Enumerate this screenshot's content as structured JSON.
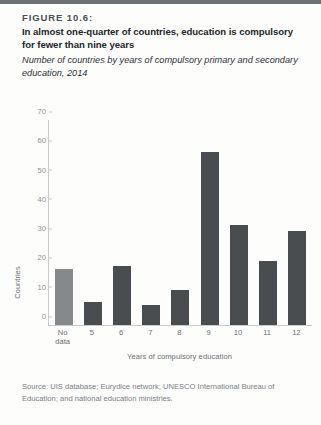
{
  "figure": {
    "label": "FIGURE 10.6:",
    "title": "In almost one-quarter of countries, education is compulsory for fewer than nine years",
    "subtitle": "Number of countries by years of compulsory primary and secondary education, 2014",
    "source": "Source: UIS database; Eurydice network; UNESCO International Bureau of Education; and national education ministries."
  },
  "colors": {
    "bar_default": "#4a4d50",
    "bar_no_data": "#86898c",
    "axis": "#c8cacb",
    "tick_label": "#8c9197",
    "axis_title": "#6a6f75",
    "top_rule": "#6f7378"
  },
  "chart_data": {
    "type": "bar",
    "title": "In almost one-quarter of countries, education is compulsory for fewer than nine years",
    "subtitle": "Number of countries by years of compulsory primary and secondary education, 2014",
    "xlabel": "Years of compulsory education",
    "ylabel": "Countries",
    "ylim": [
      0,
      70
    ],
    "yticks": [
      0,
      10,
      20,
      30,
      40,
      50,
      60,
      70
    ],
    "grid": false,
    "legend": null,
    "categories": [
      "No data",
      "5",
      "6",
      "7",
      "8",
      "9",
      "10",
      "11",
      "12"
    ],
    "values": [
      19,
      8,
      20,
      7,
      12,
      59,
      34,
      22,
      32
    ],
    "bar_colors": [
      "#86898c",
      "#4a4d50",
      "#4a4d50",
      "#4a4d50",
      "#4a4d50",
      "#4a4d50",
      "#4a4d50",
      "#4a4d50",
      "#4a4d50"
    ]
  }
}
